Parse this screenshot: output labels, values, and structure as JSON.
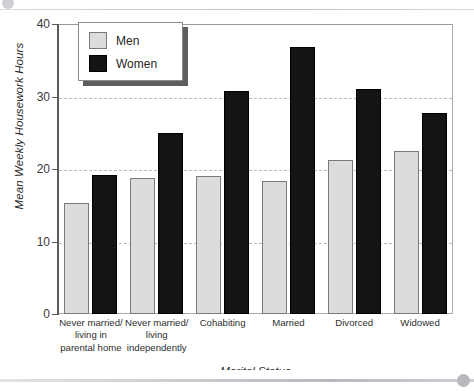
{
  "window": {
    "top_clipped_text": "",
    "scrollbar": {
      "name": "horizontal-scrollbar"
    }
  },
  "chart_data": {
    "type": "bar",
    "title": "",
    "xlabel": "Marital Status",
    "ylabel": "Mean Weekly Housework Hours",
    "ylim": [
      0,
      40
    ],
    "yticks": [
      "0",
      "10",
      "20",
      "30",
      "40"
    ],
    "ytick_values": [
      0,
      10,
      20,
      30,
      40
    ],
    "grid": "horizontal-dashed",
    "legend_position": "top-left-inside",
    "categories": [
      "Never married/ living in parental home",
      "Never married/ living independently",
      "Cohabiting",
      "Married",
      "Divorced",
      "Widowed"
    ],
    "category_lines": [
      [
        "Never married/",
        "living in",
        "parental home"
      ],
      [
        "Never married/",
        "living",
        "independently"
      ],
      [
        "Cohabiting"
      ],
      [
        "Married"
      ],
      [
        "Divorced"
      ],
      [
        "Widowed"
      ]
    ],
    "series": [
      {
        "name": "Men",
        "color": "#dcdcdc",
        "values": [
          15.3,
          18.8,
          19.0,
          18.3,
          21.3,
          22.5
        ]
      },
      {
        "name": "Women",
        "color": "#141414",
        "values": [
          19.2,
          25.0,
          30.8,
          36.8,
          31.0,
          27.7
        ]
      }
    ]
  },
  "legend": {
    "items": [
      {
        "label": "Men",
        "swatch": "men"
      },
      {
        "label": "Women",
        "swatch": "women"
      }
    ]
  }
}
